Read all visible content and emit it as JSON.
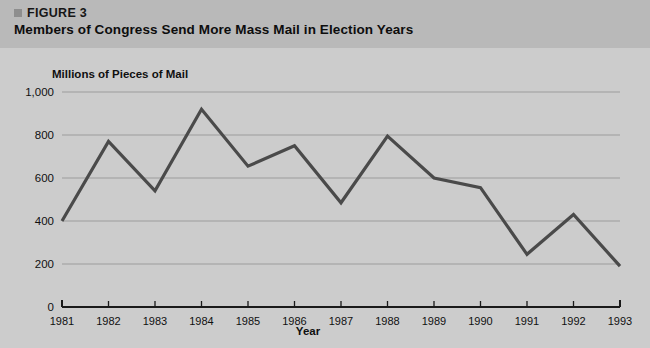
{
  "figure": {
    "bullet_icon": "square-bullet-icon",
    "label": "FIGURE 3",
    "title": "Members of Congress Send More Mass Mail in Election Years"
  },
  "colors": {
    "card_background": "#cccccc",
    "header_band": "#b9b9b9",
    "line": "#4a4a4a",
    "gridline": "#9c9c9c",
    "axis": "#1a1a1a",
    "text": "#101010"
  },
  "chart_data": {
    "type": "line",
    "title": "Members of Congress Send More Mass Mail in Election Years",
    "subtitle": "FIGURE 3",
    "xlabel": "Year",
    "ylabel": "Millions of Pieces of Mail",
    "categories": [
      "1981",
      "1982",
      "1983",
      "1984",
      "1985",
      "1986",
      "1987",
      "1988",
      "1989",
      "1990",
      "1991",
      "1992",
      "1993"
    ],
    "x": [
      1981,
      1982,
      1983,
      1984,
      1985,
      1986,
      1987,
      1988,
      1989,
      1990,
      1991,
      1992,
      1993
    ],
    "values": [
      400,
      770,
      540,
      920,
      655,
      750,
      485,
      795,
      600,
      555,
      245,
      430,
      190
    ],
    "series": [
      {
        "name": "Millions of Pieces of Mail",
        "values": [
          400,
          770,
          540,
          920,
          655,
          750,
          485,
          795,
          600,
          555,
          245,
          430,
          190
        ]
      }
    ],
    "ylim": [
      0,
      1000
    ],
    "yticks": [
      0,
      200,
      400,
      600,
      800,
      1000
    ],
    "ytick_labels": [
      "0",
      "200",
      "400",
      "600",
      "800",
      "1,000"
    ],
    "xlim": [
      1981,
      1993
    ],
    "grid": true,
    "grid_axis": "y",
    "legend": false,
    "legend_position": "none"
  }
}
